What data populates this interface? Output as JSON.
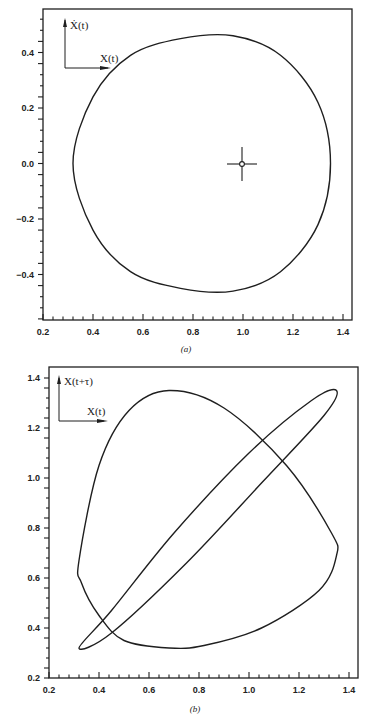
{
  "chart_data": [
    {
      "id": "a",
      "type": "line",
      "caption": "(a)",
      "title": "",
      "xlabel": "",
      "ylabel": "",
      "inset_axes": {
        "x_label": "X(t)",
        "y_label": "Ẋ(t)"
      },
      "xlim": [
        0.2,
        1.4
      ],
      "ylim": [
        -0.56,
        0.56
      ],
      "x_ticks": [
        "0.2",
        "0.4",
        "0.6",
        "0.8",
        "1.0",
        "1.2",
        "1.4"
      ],
      "y_ticks": [
        "0.4",
        "0.2",
        "0.0",
        "-0.2",
        "-0.4"
      ],
      "y_tick_values": [
        0.4,
        0.2,
        0.0,
        -0.2,
        -0.4
      ],
      "x_tick_values": [
        0.2,
        0.4,
        0.6,
        0.8,
        1.0,
        1.2,
        1.4
      ],
      "grid": false,
      "fixed_point": {
        "x": 1.0,
        "y": 0.0,
        "marker": "crosshair-circle"
      },
      "series": [
        {
          "name": "phase-portrait",
          "description": "closed limit cycle X(t) vs dX/dt",
          "points": [
            [
              0.32,
              0.0
            ],
            [
              0.4,
              0.24
            ],
            [
              0.55,
              0.39
            ],
            [
              0.75,
              0.45
            ],
            [
              0.96,
              0.46
            ],
            [
              1.15,
              0.39
            ],
            [
              1.3,
              0.22
            ],
            [
              1.35,
              0.0
            ],
            [
              1.3,
              -0.22
            ],
            [
              1.15,
              -0.39
            ],
            [
              0.96,
              -0.46
            ],
            [
              0.75,
              -0.45
            ],
            [
              0.55,
              -0.39
            ],
            [
              0.4,
              -0.24
            ],
            [
              0.32,
              0.0
            ]
          ]
        }
      ],
      "extents": {
        "x_min": 0.32,
        "x_max": 1.35,
        "y_min": -0.46,
        "y_max": 0.46
      }
    },
    {
      "id": "b",
      "type": "line",
      "caption": "(b)",
      "title": "",
      "xlabel": "",
      "ylabel": "",
      "inset_axes": {
        "x_label": "X(t)",
        "y_label": "X(t+τ)"
      },
      "xlim": [
        0.2,
        1.43
      ],
      "ylim": [
        0.2,
        1.42
      ],
      "x_ticks": [
        "0.2",
        "0.4",
        "0.6",
        "0.8",
        "1.0",
        "1.2",
        "1.4"
      ],
      "y_ticks": [
        "1.4",
        "1.2",
        "1.0",
        "0.8",
        "0.6",
        "0.4",
        "0.2"
      ],
      "x_tick_values": [
        0.2,
        0.4,
        0.6,
        0.8,
        1.0,
        1.2,
        1.4
      ],
      "y_tick_values": [
        1.4,
        1.2,
        1.0,
        0.8,
        0.6,
        0.4,
        0.2
      ],
      "grid": false,
      "series": [
        {
          "name": "delay-embedding-large-tau",
          "description": "rounded triangular loop",
          "points": [
            [
              0.32,
              0.67
            ],
            [
              0.4,
              1.05
            ],
            [
              0.52,
              1.27
            ],
            [
              0.68,
              1.35
            ],
            [
              0.9,
              1.28
            ],
            [
              1.15,
              1.05
            ],
            [
              1.33,
              0.78
            ],
            [
              1.35,
              0.69
            ],
            [
              1.28,
              0.55
            ],
            [
              1.05,
              0.4
            ],
            [
              0.82,
              0.33
            ],
            [
              0.68,
              0.32
            ],
            [
              0.5,
              0.35
            ],
            [
              0.4,
              0.45
            ],
            [
              0.33,
              0.58
            ],
            [
              0.32,
              0.67
            ]
          ]
        },
        {
          "name": "delay-embedding-small-tau",
          "description": "thin diagonal ellipse",
          "points": [
            [
              0.32,
              0.32
            ],
            [
              0.45,
              0.47
            ],
            [
              0.7,
              0.78
            ],
            [
              1.0,
              1.1
            ],
            [
              1.25,
              1.31
            ],
            [
              1.35,
              1.35
            ],
            [
              1.3,
              1.25
            ],
            [
              1.05,
              0.98
            ],
            [
              0.75,
              0.66
            ],
            [
              0.45,
              0.38
            ],
            [
              0.32,
              0.32
            ]
          ]
        }
      ]
    }
  ],
  "plots": {
    "a": {
      "caption": "(a)",
      "inset_x": "X(t)",
      "inset_y": "Ẋ(t)"
    },
    "b": {
      "caption": "(b)",
      "inset_x": "X(t)",
      "inset_y": "X(t+τ)"
    }
  },
  "style": {
    "line_color": "#1f1f1f",
    "frame_color": "#1f1f1f",
    "background": "#ffffff"
  }
}
